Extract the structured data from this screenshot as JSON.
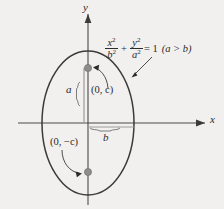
{
  "figure": {
    "kind": "ellipse-diagram",
    "background_color": "#f1f0ee",
    "ink_color": "#2b2b2b",
    "focus_dot_color": "#8c8c8c",
    "axes": {
      "y_label": "y",
      "x_label": "x",
      "origin_px": [
        88,
        123
      ]
    },
    "ellipse": {
      "center_px": [
        88,
        123
      ],
      "semi_axis_x_px": 46,
      "semi_axis_y_px": 72,
      "stroke_color": "#3a3a3a"
    },
    "equation": {
      "numerator_1": "x",
      "numerator_1_exp": "2",
      "denominator_1": "b",
      "denominator_1_exp": "2",
      "operator": "+",
      "numerator_2": "y",
      "numerator_2_exp": "2",
      "denominator_2": "a",
      "denominator_2_exp": "2",
      "equals": "= 1",
      "condition": "(a > b)"
    },
    "labels": {
      "semi_major": "a",
      "semi_minor": "b",
      "focus_upper": "(0, c)",
      "focus_lower": "(0, −c)"
    },
    "focus_points": {
      "upper_px": [
        88,
        68
      ],
      "lower_px": [
        88,
        172
      ]
    }
  }
}
